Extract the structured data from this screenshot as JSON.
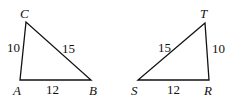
{
  "triangles": [
    {
      "vertices": {
        "C": "C",
        "A": "A",
        "B": "B"
      },
      "sides": {
        "CA": "10",
        "CB": "15",
        "AB": "12"
      }
    },
    {
      "vertices": {
        "T": "T",
        "S": "S",
        "R": "R"
      },
      "sides": {
        "ST": "15",
        "TR": "10",
        "SR": "12"
      }
    }
  ]
}
